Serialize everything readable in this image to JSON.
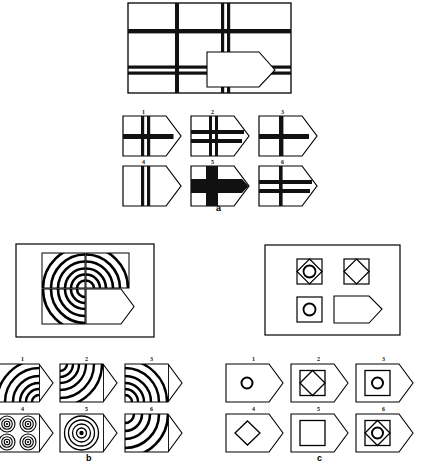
{
  "document": {
    "type": "non-verbal-reasoning-test",
    "background_color": "#ffffff",
    "ink_color": "#000000",
    "panel_count": 3
  },
  "panels": [
    {
      "id": "a",
      "letter_label": "a",
      "matrix": {
        "name": "grid-of-bars-matrix",
        "description": "Large rectangle crossed by thick horizontal and vertical bars; the answer-shape (pentagon tag) sits at lower right of centre",
        "border": true,
        "vertical_bars": [
          "single-left",
          "single-mid",
          "double-right"
        ],
        "horizontal_bars": [
          "single-upper",
          "double-lower"
        ],
        "answer_shape": "pentagon-tag"
      },
      "options": [
        {
          "number": "1",
          "vertical": "double",
          "horizontal": "single",
          "fill": "outline",
          "description": "double vertical bar, single horizontal bar"
        },
        {
          "number": "2",
          "vertical": "double",
          "horizontal": "double",
          "fill": "outline",
          "description": "double vertical bar, double horizontal bar"
        },
        {
          "number": "3",
          "vertical": "single",
          "horizontal": "single",
          "fill": "outline",
          "description": "single vertical bar, single horizontal bar"
        },
        {
          "number": "4",
          "vertical": "double",
          "horizontal": "none",
          "fill": "outline",
          "description": "double vertical bar only"
        },
        {
          "number": "5",
          "vertical": "thick-single",
          "horizontal": "thick-single",
          "fill": "solid-black-cross",
          "description": "very thick black cross"
        },
        {
          "number": "6",
          "vertical": "single",
          "horizontal": "double",
          "fill": "outline",
          "description": "single vertical bar, double horizontal bar"
        }
      ]
    },
    {
      "id": "b",
      "letter_label": "b",
      "matrix": {
        "name": "concentric-arcs-matrix",
        "description": "Large rectangle containing four square cells; three cells hold concentric arcs radiating from the shared centre, fourth cell is the pentagon tag answer slot",
        "border": true,
        "cells": [
          "arcs-from-bottom-right",
          "arcs-from-bottom-left",
          "arcs-from-top-right",
          "answer-pentagon-tag"
        ],
        "answer_shape": "pentagon-tag"
      },
      "options": [
        {
          "number": "1",
          "pattern": "arcs",
          "origin": "bottom-right",
          "description": "concentric arcs centred on bottom-right corner"
        },
        {
          "number": "2",
          "pattern": "arcs",
          "origin": "top-left",
          "description": "concentric arcs centred on top-left corner"
        },
        {
          "number": "3",
          "pattern": "arcs",
          "origin": "bottom-left",
          "description": "concentric arcs centred on bottom-left corner"
        },
        {
          "number": "4",
          "pattern": "four-small-concentric-circles",
          "origin": "quadrants",
          "description": "four small bullseye circles in a 2x2 arrangement"
        },
        {
          "number": "5",
          "pattern": "concentric-circles",
          "origin": "centre",
          "description": "single centred bullseye of concentric circles with solid dot"
        },
        {
          "number": "6",
          "pattern": "arcs",
          "origin": "top-left",
          "description": "concentric arcs centred on top-left corner, wider spacing"
        }
      ]
    },
    {
      "id": "c",
      "letter_label": "c",
      "matrix": {
        "name": "square-diamond-circle-matrix",
        "description": "Large rectangle with small square figures; top-left square contains diamond and circle, top-right square contains diamond, bottom-left square contains circle, bottom-right is the pentagon tag answer slot",
        "border": true,
        "cells": [
          "square-with-diamond-and-circle",
          "square-with-diamond",
          "square-with-circle",
          "answer-pentagon-tag"
        ],
        "answer_shape": "pentagon-tag"
      },
      "options": [
        {
          "number": "1",
          "shapes": [
            "circle"
          ],
          "description": "small circle only"
        },
        {
          "number": "2",
          "shapes": [
            "square",
            "diamond"
          ],
          "description": "square containing a diamond"
        },
        {
          "number": "3",
          "shapes": [
            "square",
            "circle"
          ],
          "description": "square containing a circle"
        },
        {
          "number": "4",
          "shapes": [
            "diamond"
          ],
          "description": "diamond only"
        },
        {
          "number": "5",
          "shapes": [
            "square"
          ],
          "description": "square only"
        },
        {
          "number": "6",
          "shapes": [
            "square",
            "diamond",
            "circle"
          ],
          "description": "square containing diamond containing circle"
        }
      ]
    }
  ]
}
